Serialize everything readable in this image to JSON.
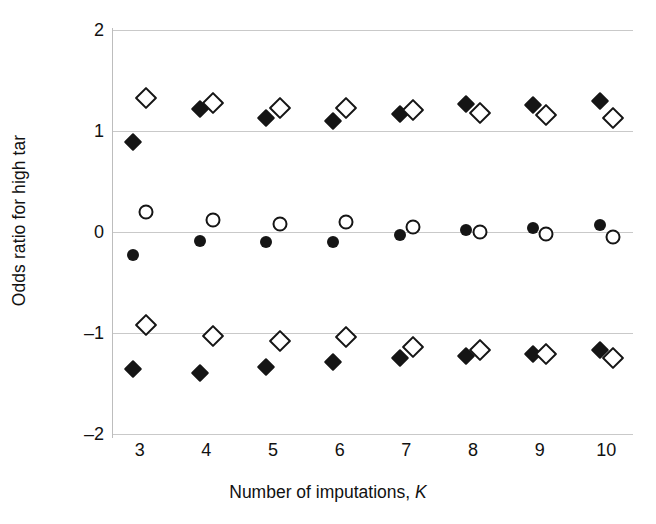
{
  "chart_data": {
    "type": "scatter",
    "title": "",
    "xlabel": "Number of imputations, K",
    "xlabel_plain": "Number of imputations,",
    "xlabel_italic": "K",
    "ylabel": "Odds ratio for high tar",
    "xlim": [
      2.6,
      10.4
    ],
    "ylim": [
      -2,
      2
    ],
    "xticks": [
      3,
      4,
      5,
      6,
      7,
      8,
      9,
      10
    ],
    "xtick_labels": [
      "3",
      "4",
      "5",
      "6",
      "7",
      "8",
      "9",
      "10"
    ],
    "yticks": [
      2,
      1,
      0,
      -1,
      -2
    ],
    "ytick_labels": [
      "2",
      "1",
      "0",
      "-1",
      "-2"
    ],
    "gridlines": [
      2,
      1,
      0,
      -1,
      -2
    ],
    "grid": true,
    "grid_color": "#c9c9c9",
    "marker_color": "#151515",
    "legend": "none",
    "x": [
      3,
      4,
      5,
      6,
      7,
      8,
      9,
      10
    ],
    "series": [
      {
        "name": "Upper limit (filled diamond)",
        "marker": "filled-diamond",
        "x_offset": -0.1,
        "values": [
          0.89,
          1.22,
          1.13,
          1.1,
          1.17,
          1.27,
          1.26,
          1.3
        ]
      },
      {
        "name": "Upper limit (open diamond)",
        "marker": "open-diamond",
        "x_offset": 0.1,
        "values": [
          1.33,
          1.28,
          1.23,
          1.23,
          1.21,
          1.18,
          1.16,
          1.13
        ]
      },
      {
        "name": "Estimate (filled circle)",
        "marker": "filled-circle",
        "x_offset": -0.1,
        "values": [
          -0.23,
          -0.09,
          -0.1,
          -0.1,
          -0.03,
          0.02,
          0.04,
          0.07
        ]
      },
      {
        "name": "Estimate (open circle)",
        "marker": "open-circle",
        "x_offset": 0.1,
        "values": [
          0.2,
          0.12,
          0.08,
          0.1,
          0.05,
          0.0,
          -0.02,
          -0.05
        ]
      },
      {
        "name": "Lower limit (filled diamond)",
        "marker": "filled-diamond",
        "x_offset": -0.1,
        "values": [
          -1.36,
          -1.4,
          -1.34,
          -1.29,
          -1.25,
          -1.23,
          -1.21,
          -1.17
        ]
      },
      {
        "name": "Lower limit (open diamond)",
        "marker": "open-diamond",
        "x_offset": 0.1,
        "values": [
          -0.92,
          -1.03,
          -1.08,
          -1.04,
          -1.14,
          -1.17,
          -1.21,
          -1.25
        ]
      }
    ]
  }
}
